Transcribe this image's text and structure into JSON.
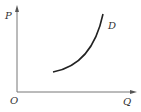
{
  "diagram": {
    "type": "economics-curve",
    "labels": {
      "y_axis": "P",
      "x_axis": "Q",
      "origin": "O",
      "curve": "D"
    },
    "colors": {
      "axis": "#777777",
      "curve": "#222222",
      "text": "#333333",
      "background": "#ffffff"
    },
    "curve_shape": "upward-sloping convex"
  }
}
